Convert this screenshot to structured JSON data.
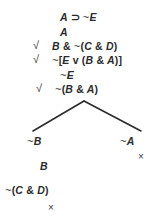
{
  "diagram": {
    "type": "truth-tree",
    "background_color": "#ffffff",
    "ink_color": "#2b2b2b",
    "trunk": [
      {
        "id": "line-1",
        "text": "A ⊃ ~E",
        "checked": false,
        "check_mark": ""
      },
      {
        "id": "line-2",
        "text": "A",
        "checked": false,
        "check_mark": ""
      },
      {
        "id": "line-3",
        "text": "B & ~(C & D)",
        "checked": true,
        "check_mark": "√"
      },
      {
        "id": "line-4",
        "text": "~[E v (B & A)]",
        "checked": true,
        "check_mark": "√"
      },
      {
        "id": "line-5",
        "text": "~E",
        "checked": false,
        "check_mark": ""
      },
      {
        "id": "line-6",
        "text": "~(B & A)",
        "checked": true,
        "check_mark": "√"
      }
    ],
    "branches": {
      "left": {
        "label": "left-branch",
        "nodes": [
          {
            "id": "left-1",
            "text": "~B"
          },
          {
            "id": "left-2",
            "text": "B"
          },
          {
            "id": "left-3",
            "text": "~(C & D)"
          }
        ],
        "closed": true,
        "close_mark": "×"
      },
      "right": {
        "label": "right-branch",
        "nodes": [
          {
            "id": "right-1",
            "text": "~A"
          }
        ],
        "closed": true,
        "close_mark": "×"
      }
    },
    "edges": [
      {
        "id": "edge-left",
        "from": [
          84,
          101
        ],
        "to": [
          33,
          131
        ]
      },
      {
        "id": "edge-right",
        "from": [
          84,
          101
        ],
        "to": [
          141,
          131
        ]
      }
    ]
  }
}
